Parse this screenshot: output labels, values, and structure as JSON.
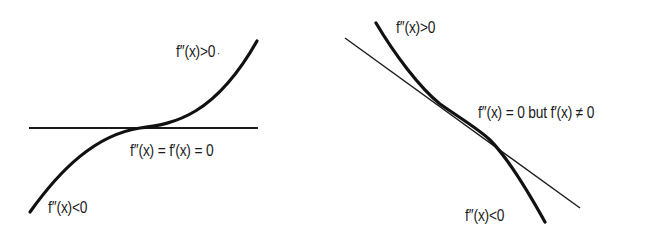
{
  "figure": {
    "panels": [
      {
        "id": "horizontal-inflection",
        "description": "Inflection point with horizontal tangent",
        "labels": {
          "upper": "f′′(x)>0",
          "upper_dot": "·",
          "middle": "f′′(x) = f′(x) = 0",
          "lower": "f′′(x)<0"
        }
      },
      {
        "id": "sloped-inflection",
        "description": "Inflection point with non-horizontal tangent",
        "labels": {
          "upper": "f′′(x)>0",
          "middle": "f′′(x) = 0 but f′(x) ≠ 0",
          "lower": "f′′(x)<0"
        }
      }
    ],
    "colors": {
      "ink": "#1a1a1a",
      "background": "#ffffff"
    }
  }
}
